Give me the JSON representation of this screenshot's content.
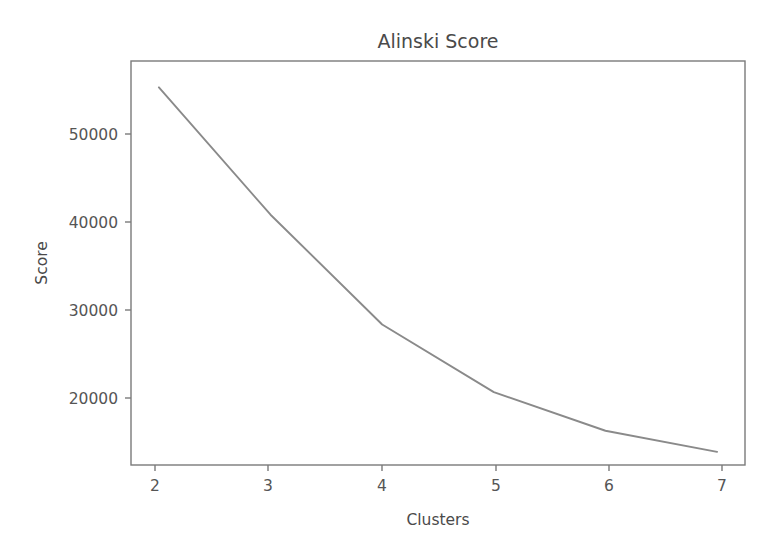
{
  "figure": {
    "background_color": "#ffffff",
    "line_color": "#8a8a8a",
    "axis_color": "#7a7a7a",
    "text_color": "#4a4a4a"
  },
  "chart_data": {
    "type": "line",
    "title": "Alinski Score",
    "xlabel": "Clusters",
    "ylabel": "Score",
    "x": [
      2,
      3,
      4,
      5,
      6,
      7
    ],
    "values": [
      56500,
      42000,
      29500,
      21800,
      17400,
      15000
    ],
    "series": [
      {
        "name": "Alinski Score",
        "values": [
          56500,
          42000,
          29500,
          21800,
          17400,
          15000
        ]
      }
    ],
    "xticks": [
      2,
      3,
      4,
      5,
      6,
      7
    ],
    "xtick_labels": [
      "2",
      "3",
      "4",
      "5",
      "6",
      "7"
    ],
    "yticks": [
      20000,
      30000,
      40000,
      50000
    ],
    "ytick_labels": [
      "20000",
      "30000",
      "40000",
      "50000"
    ],
    "xlim": [
      1.75,
      7.25
    ],
    "ylim": [
      13500,
      59500
    ],
    "grid": false,
    "legend": false,
    "legend_position": "none"
  }
}
